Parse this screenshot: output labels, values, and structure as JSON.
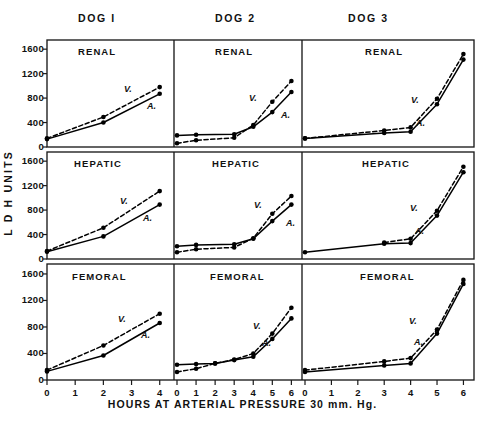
{
  "figure": {
    "y_axis_title": "L D H  UNITS",
    "x_axis_title": "HOURS AT ARTERIAL PRESSURE  30 mm. Hg.",
    "column_titles": [
      "DOG  I",
      "DOG  2",
      "DOG  3"
    ],
    "row_titles": [
      "RENAL",
      "HEPATIC",
      "FEMORAL"
    ],
    "series_labels": {
      "arterial": "A.",
      "venous": "V."
    },
    "y_ticks": [
      0,
      400,
      800,
      1200,
      1600
    ],
    "y_tick_labels": [
      "0",
      "400",
      "800",
      "1200",
      "1600"
    ],
    "x_ticks_dog1": [
      0,
      1,
      2,
      3,
      4
    ],
    "x_tick_labels_dog1": [
      "0",
      "1",
      "2",
      "3",
      "4"
    ],
    "x_ticks_dog2": [
      0,
      1,
      2,
      3,
      4,
      5,
      6
    ],
    "x_tick_labels_dog2": [
      "0",
      "1",
      "2",
      "3",
      "4",
      "5",
      "6"
    ],
    "x_ticks_dog3": [
      0,
      1,
      2,
      3,
      4,
      5,
      6
    ],
    "x_tick_labels_dog3": [
      "0",
      "1",
      "2",
      "3",
      "4",
      "5",
      "6"
    ],
    "ink_color": "#111111",
    "background_color": "#ffffff"
  },
  "chart_data": {
    "type": "line",
    "xlabel": "HOURS AT ARTERIAL PRESSURE 30 mm. Hg.",
    "ylabel": "L D H UNITS",
    "ylim": [
      0,
      1750
    ],
    "grid": false,
    "legend": "inline-annotations",
    "legend_entries": [
      "A. (arterial, solid line)",
      "V. (venous, dashed line)"
    ],
    "panels": [
      {
        "column": "DOG  I",
        "row": "RENAL",
        "xlim": [
          0,
          4.4
        ],
        "series": [
          {
            "name": "A.",
            "style": "solid",
            "x": [
              0,
              2,
              4
            ],
            "values": [
              130,
              400,
              870
            ]
          },
          {
            "name": "V.",
            "style": "dashed",
            "x": [
              0,
              2,
              4
            ],
            "values": [
              140,
              490,
              980
            ]
          }
        ]
      },
      {
        "column": "DOG  2",
        "row": "RENAL",
        "xlim": [
          0,
          6.4
        ],
        "series": [
          {
            "name": "A.",
            "style": "solid",
            "x": [
              0,
              1,
              3,
              4,
              5,
              6
            ],
            "values": [
              190,
              200,
              210,
              330,
              570,
              900
            ]
          },
          {
            "name": "V.",
            "style": "dashed",
            "x": [
              0,
              1,
              3,
              4,
              5,
              6
            ],
            "values": [
              60,
              110,
              150,
              360,
              740,
              1080
            ]
          }
        ]
      },
      {
        "column": "DOG  3",
        "row": "RENAL",
        "xlim": [
          0,
          6.4
        ],
        "series": [
          {
            "name": "A.",
            "style": "solid",
            "x": [
              0,
              3,
              4,
              5,
              6
            ],
            "values": [
              140,
              230,
              250,
              700,
              1430
            ]
          },
          {
            "name": "V.",
            "style": "dashed",
            "x": [
              0,
              3,
              4,
              5,
              6
            ],
            "values": [
              140,
              270,
              320,
              790,
              1520
            ]
          }
        ]
      },
      {
        "column": "DOG  I",
        "row": "HEPATIC",
        "xlim": [
          0,
          4.4
        ],
        "series": [
          {
            "name": "A.",
            "style": "solid",
            "x": [
              0,
              2,
              4
            ],
            "values": [
              120,
              370,
              890
            ]
          },
          {
            "name": "V.",
            "style": "dashed",
            "x": [
              0,
              2,
              4
            ],
            "values": [
              130,
              510,
              1110
            ]
          }
        ]
      },
      {
        "column": "DOG  2",
        "row": "HEPATIC",
        "xlim": [
          0,
          6.4
        ],
        "series": [
          {
            "name": "A.",
            "style": "solid",
            "x": [
              0,
              1,
              3,
              4,
              5,
              6
            ],
            "values": [
              210,
              230,
              240,
              330,
              620,
              890
            ]
          },
          {
            "name": "V.",
            "style": "dashed",
            "x": [
              0,
              1,
              3,
              4,
              5,
              6
            ],
            "values": [
              110,
              160,
              190,
              340,
              740,
              1030
            ]
          }
        ]
      },
      {
        "column": "DOG  3",
        "row": "HEPATIC",
        "xlim": [
          0,
          6.4
        ],
        "series": [
          {
            "name": "A.",
            "style": "solid",
            "x": [
              0,
              3,
              4,
              5,
              6
            ],
            "values": [
              110,
              250,
              260,
              710,
              1420
            ]
          },
          {
            "name": "V.",
            "style": "dashed",
            "x": [
              3,
              4,
              5,
              6
            ],
            "values": [
              270,
              330,
              790,
              1510
            ]
          }
        ]
      },
      {
        "column": "DOG  I",
        "row": "FEMORAL",
        "xlim": [
          0,
          4.4
        ],
        "series": [
          {
            "name": "A.",
            "style": "solid",
            "x": [
              0,
              2,
              4
            ],
            "values": [
              130,
              370,
              860
            ]
          },
          {
            "name": "V.",
            "style": "dashed",
            "x": [
              0,
              2,
              4
            ],
            "values": [
              150,
              520,
              1000
            ]
          }
        ]
      },
      {
        "column": "DOG  2",
        "row": "FEMORAL",
        "xlim": [
          0,
          6.4
        ],
        "series": [
          {
            "name": "A.",
            "style": "solid",
            "x": [
              0,
              1,
              2,
              3,
              4,
              5,
              6
            ],
            "values": [
              230,
              240,
              250,
              300,
              350,
              620,
              930
            ]
          },
          {
            "name": "V.",
            "style": "dashed",
            "x": [
              0,
              1,
              2,
              3,
              4,
              5,
              6
            ],
            "values": [
              120,
              170,
              250,
              310,
              400,
              700,
              1090
            ]
          }
        ]
      },
      {
        "column": "DOG  3",
        "row": "FEMORAL",
        "xlim": [
          0,
          6.4
        ],
        "series": [
          {
            "name": "A.",
            "style": "solid",
            "x": [
              0,
              3,
              4,
              5,
              6
            ],
            "values": [
              120,
              220,
              250,
              700,
              1450
            ]
          },
          {
            "name": "V.",
            "style": "dashed",
            "x": [
              0,
              3,
              4,
              5,
              6
            ],
            "values": [
              150,
              280,
              330,
              760,
              1510
            ]
          }
        ]
      }
    ]
  }
}
